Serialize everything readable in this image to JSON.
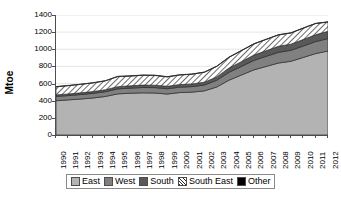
{
  "chart_data": {
    "type": "area",
    "stacked": true,
    "title": "",
    "xlabel": "",
    "ylabel": "Mtoe",
    "ylim": [
      0,
      1400
    ],
    "yticks": [
      0,
      200,
      400,
      600,
      800,
      1000,
      1200,
      1400
    ],
    "grid": true,
    "legend_position": "bottom",
    "categories": [
      "1990",
      "1991",
      "1992",
      "1993",
      "1994",
      "1995",
      "1996",
      "1997",
      "1998",
      "1999",
      "2000",
      "2001",
      "2002",
      "2003",
      "2004",
      "2005",
      "2006",
      "2007",
      "2008",
      "2009",
      "2010",
      "2011",
      "2012"
    ],
    "series": [
      {
        "name": "East",
        "color": "#b3b3b3",
        "pattern": "solid",
        "values": [
          400,
          410,
          420,
          432,
          450,
          480,
          487,
          492,
          490,
          478,
          495,
          500,
          515,
          560,
          640,
          700,
          760,
          800,
          840,
          860,
          905,
          950,
          980
        ]
      },
      {
        "name": "West",
        "color": "#808080",
        "pattern": "solid",
        "values": [
          50,
          50,
          52,
          54,
          55,
          58,
          60,
          62,
          63,
          62,
          63,
          65,
          68,
          78,
          92,
          100,
          110,
          118,
          125,
          128,
          133,
          140,
          145
        ]
      },
      {
        "name": "South",
        "color": "#595959",
        "pattern": "solid",
        "values": [
          18,
          19,
          20,
          21,
          23,
          26,
          27,
          28,
          28,
          28,
          30,
          31,
          33,
          40,
          50,
          56,
          62,
          66,
          70,
          72,
          76,
          80,
          85
        ]
      },
      {
        "name": "South East",
        "color": "#ffffff",
        "pattern": "diagonal-hatch",
        "values": [
          95,
          97,
          99,
          101,
          104,
          118,
          113,
          115,
          114,
          110,
          112,
          113,
          116,
          122,
          125,
          128,
          130,
          131,
          133,
          130,
          132,
          130,
          108
        ]
      },
      {
        "name": "Other",
        "color": "#000000",
        "pattern": "solid",
        "values": [
          2,
          2,
          2,
          2,
          2,
          3,
          3,
          3,
          3,
          3,
          3,
          3,
          3,
          3,
          3,
          3,
          3,
          3,
          3,
          3,
          3,
          3,
          3
        ]
      }
    ],
    "totals": [
      565,
      578,
      593,
      610,
      634,
      685,
      690,
      700,
      698,
      681,
      703,
      712,
      735,
      803,
      910,
      987,
      1065,
      1118,
      1171,
      1193,
      1249,
      1303,
      1321
    ]
  },
  "legend": {
    "items": [
      {
        "label": "East",
        "swatch": "light-gray"
      },
      {
        "label": "West",
        "swatch": "medium-gray"
      },
      {
        "label": "South",
        "swatch": "dark-gray"
      },
      {
        "label": "South East",
        "swatch": "hatched"
      },
      {
        "label": "Other",
        "swatch": "black"
      }
    ]
  }
}
